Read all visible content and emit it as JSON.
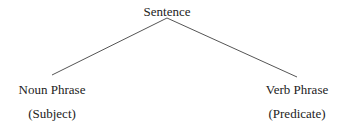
{
  "diagram": {
    "type": "tree",
    "root": {
      "label": "Sentence"
    },
    "children": [
      {
        "label": "Noun Phrase",
        "sublabel": "(Subject)"
      },
      {
        "label": "Verb Phrase",
        "sublabel": "(Predicate)"
      }
    ],
    "colors": {
      "text": "#222222",
      "line": "#555555",
      "background": "#ffffff"
    }
  }
}
